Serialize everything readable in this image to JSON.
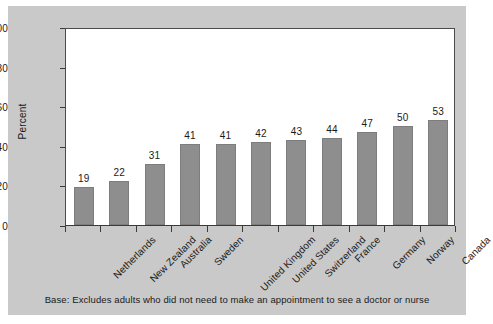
{
  "chart_data": {
    "type": "bar",
    "title": "",
    "xlabel": "",
    "ylabel": "Percent",
    "ylim": [
      0,
      100
    ],
    "yticks": [
      0,
      20,
      40,
      60,
      80,
      100
    ],
    "grid": false,
    "legend": "none",
    "bar_color": "#8e8e8e",
    "categories": [
      "Netherlands",
      "New Zealand",
      "Australia",
      "Sweden",
      "United Kingdom",
      "United States",
      "Switzerland",
      "France",
      "Germany",
      "Norway",
      "Canada"
    ],
    "values": [
      19,
      22,
      31,
      41,
      41,
      42,
      43,
      44,
      47,
      50,
      53
    ],
    "annotations": [
      "Base: Excludes adults who did not need to make an appointment to see a doctor or nurse"
    ]
  },
  "figure": {
    "footnote": "Base: Excludes adults who did not need to make an appointment to see a doctor or nurse",
    "background_color": "#c9c9c9",
    "plot_background_color": "#ffffff"
  }
}
